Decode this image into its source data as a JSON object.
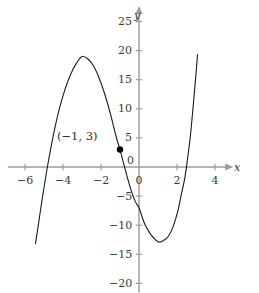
{
  "chart_data": {
    "type": "line",
    "title": "",
    "xlabel": "x",
    "ylabel": "y",
    "grid": false,
    "legend": "none",
    "xlim": [
      -6.9,
      4.9
    ],
    "ylim": [
      -21.5,
      27.5
    ],
    "x_ticks": [
      {
        "value": -6,
        "label": "−6"
      },
      {
        "value": -4,
        "label": "−4"
      },
      {
        "value": -2,
        "label": "−2"
      },
      {
        "value": 0,
        "label": "0"
      },
      {
        "value": 2,
        "label": "2"
      },
      {
        "value": 4,
        "label": "4"
      }
    ],
    "y_ticks": [
      {
        "value": 25,
        "label": "25"
      },
      {
        "value": 20,
        "label": "20"
      },
      {
        "value": 15,
        "label": "15"
      },
      {
        "value": 10,
        "label": "10"
      },
      {
        "value": 5,
        "label": "5"
      },
      {
        "value": 0,
        "label": "0"
      },
      {
        "value": -5,
        "label": "−5"
      },
      {
        "value": -10,
        "label": "−10"
      },
      {
        "value": -15,
        "label": "−15"
      },
      {
        "value": -20,
        "label": "−20"
      }
    ],
    "series": [
      {
        "name": "cubic-curve",
        "color": "#1a1a1a",
        "points": [
          [
            -5.45,
            -13.2
          ],
          [
            -5.3,
            -10.0
          ],
          [
            -5.1,
            -5.6
          ],
          [
            -4.9,
            -1.5
          ],
          [
            -4.74,
            1.5
          ],
          [
            -4.5,
            5.6
          ],
          [
            -4.2,
            9.9
          ],
          [
            -3.9,
            13.3
          ],
          [
            -3.6,
            15.9
          ],
          [
            -3.3,
            17.8
          ],
          [
            -3.0,
            19.0
          ],
          [
            -2.7,
            18.6
          ],
          [
            -2.4,
            17.4
          ],
          [
            -2.1,
            15.3
          ],
          [
            -1.8,
            12.5
          ],
          [
            -1.5,
            9.1
          ],
          [
            -1.2,
            5.2
          ],
          [
            -1.0,
            3.0
          ],
          [
            -0.8,
            0.5
          ],
          [
            -0.5,
            -3.1
          ],
          [
            -0.2,
            -5.9
          ],
          [
            0.0,
            -7.0
          ],
          [
            0.3,
            -9.8
          ],
          [
            0.6,
            -11.5
          ],
          [
            0.9,
            -12.6
          ],
          [
            1.1,
            -12.9
          ],
          [
            1.3,
            -12.6
          ],
          [
            1.55,
            -11.9
          ],
          [
            1.8,
            -10.2
          ],
          [
            2.05,
            -7.5
          ],
          [
            2.22,
            -4.8
          ],
          [
            2.4,
            -2.1
          ],
          [
            2.55,
            1.3
          ],
          [
            2.7,
            5.2
          ],
          [
            2.85,
            10.4
          ],
          [
            3.0,
            16.0
          ],
          [
            3.08,
            19.3
          ]
        ]
      }
    ],
    "annotations": [
      {
        "name": "marked-point",
        "label": "(−1,  3)",
        "x": -1,
        "y": 3,
        "marker": "filled-circle",
        "marker_color": "#000000"
      }
    ],
    "axis_color": "#9b9b9b",
    "tick_color": "#9b9b9b",
    "label_color": "#3a3a3a",
    "curve_color": "#1a1a1a",
    "background": "#ffffff"
  }
}
